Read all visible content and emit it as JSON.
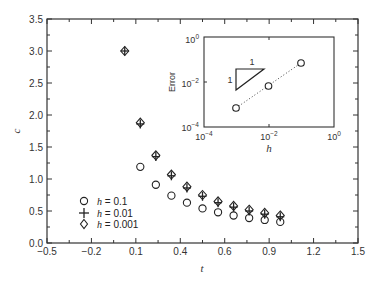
{
  "chart_data": [
    {
      "type": "scatter",
      "title": "",
      "xlabel": "t",
      "ylabel": "c",
      "xlim": [
        -0.5,
        1.5
      ],
      "ylim": [
        0.0,
        3.5
      ],
      "xticks": [
        "-0.5",
        "-0.2",
        "0.1",
        "0.4",
        "0.6",
        "0.9",
        "1.2",
        "1.5"
      ],
      "xtick_values": [
        -0.5,
        -0.2,
        0.1,
        0.4,
        0.6,
        0.9,
        1.2,
        1.5
      ],
      "yticks": [
        "0.0",
        "0.5",
        "1.0",
        "1.5",
        "2.0",
        "2.5",
        "3.0",
        "3.5"
      ],
      "grid": false,
      "legend_position": "lower left",
      "series": [
        {
          "name": "h = 0.1",
          "marker": "circle",
          "x": [
            0.1,
            0.2,
            0.3,
            0.4,
            0.5,
            0.6,
            0.7,
            0.8,
            0.9,
            1.0
          ],
          "y": [
            1.19,
            0.91,
            0.74,
            0.63,
            0.54,
            0.48,
            0.43,
            0.39,
            0.36,
            0.33
          ]
        },
        {
          "name": "h = 0.01",
          "marker": "plus",
          "x": [
            0.0,
            0.1,
            0.2,
            0.3,
            0.4,
            0.5,
            0.6,
            0.7,
            0.8,
            0.9,
            1.0
          ],
          "y": [
            3.0,
            1.86,
            1.35,
            1.05,
            0.86,
            0.73,
            0.63,
            0.56,
            0.5,
            0.45,
            0.41
          ]
        },
        {
          "name": "h = 0.001",
          "marker": "diamond",
          "x": [
            0.0,
            0.1,
            0.2,
            0.3,
            0.4,
            0.5,
            0.6,
            0.7,
            0.8,
            0.9,
            1.0
          ],
          "y": [
            3.0,
            1.88,
            1.37,
            1.07,
            0.88,
            0.75,
            0.65,
            0.58,
            0.52,
            0.47,
            0.43
          ]
        }
      ]
    },
    {
      "type": "line",
      "title": "inset",
      "xlabel": "h",
      "ylabel": "Error",
      "xscale": "log",
      "yscale": "log",
      "xlim": [
        0.0001,
        1
      ],
      "ylim": [
        0.0001,
        1
      ],
      "xticks": [
        "10^-4",
        "10^-2",
        "10^0"
      ],
      "yticks": [
        "10^-4",
        "10^-2",
        "10^0"
      ],
      "series": [
        {
          "name": "error",
          "marker": "circle",
          "linestyle": "dotted",
          "x": [
            0.001,
            0.01,
            0.1
          ],
          "y": [
            0.0007,
            0.007,
            0.07
          ]
        }
      ],
      "annotations": [
        {
          "type": "slope-triangle",
          "run_label": "1",
          "rise_label": "1"
        }
      ]
    }
  ],
  "main": {
    "xlabel": "t",
    "ylabel": "c",
    "xticks": [
      "−0.5",
      "−0.2",
      "0.1",
      "0.4",
      "0.6",
      "0.9",
      "1.2",
      "1.5"
    ],
    "yticks": [
      "0.0",
      "0.5",
      "1.0",
      "1.5",
      "2.0",
      "2.5",
      "3.0",
      "3.5"
    ],
    "legend": [
      {
        "symbol": "circle",
        "h_label": "h",
        "value_label": " = 0.1"
      },
      {
        "symbol": "plus",
        "h_label": "h",
        "value_label": " = 0.01"
      },
      {
        "symbol": "diamond",
        "h_label": "h",
        "value_label": " = 0.001"
      }
    ]
  },
  "inset": {
    "xlabel": "h",
    "ylabel": "Error",
    "triangle_run": "1",
    "triangle_rise": "1",
    "xticks": [
      {
        "base": "10",
        "exp": "−4"
      },
      {
        "base": "10",
        "exp": "−2"
      },
      {
        "base": "10",
        "exp": "0"
      }
    ],
    "yticks": [
      {
        "base": "10",
        "exp": "0"
      },
      {
        "base": "10",
        "exp": "−2"
      },
      {
        "base": "10",
        "exp": "−4"
      }
    ]
  }
}
